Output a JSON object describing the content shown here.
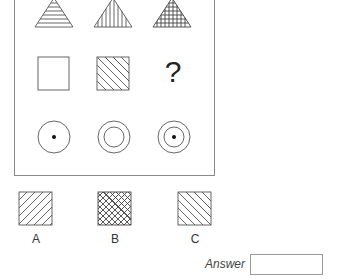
{
  "puzzle": {
    "grid": [
      [
        {
          "shape": "triangle",
          "fill": "horizontal-lines"
        },
        {
          "shape": "triangle",
          "fill": "vertical-lines"
        },
        {
          "shape": "triangle",
          "fill": "grid-lines"
        }
      ],
      [
        {
          "shape": "square",
          "fill": "empty"
        },
        {
          "shape": "square",
          "fill": "diagonal-lines-down"
        },
        {
          "shape": "missing",
          "symbol": "?"
        }
      ],
      [
        {
          "shape": "circle",
          "fill": "dot"
        },
        {
          "shape": "double-circle",
          "fill": "empty"
        },
        {
          "shape": "double-circle",
          "fill": "dot"
        }
      ]
    ],
    "missing_symbol": "?"
  },
  "options": [
    {
      "label": "A",
      "shape": "square",
      "fill": "diagonal-lines-up"
    },
    {
      "label": "B",
      "shape": "square",
      "fill": "diagonal-cross-hatch"
    },
    {
      "label": "C",
      "shape": "square",
      "fill": "diagonal-lines-down"
    }
  ],
  "answer": {
    "label": "Answer",
    "value": ""
  },
  "colors": {
    "stroke": "#555555",
    "frame": "#8a8a8a",
    "background": "#ffffff"
  }
}
